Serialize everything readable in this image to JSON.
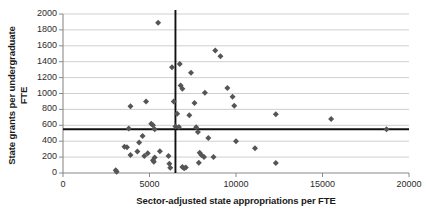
{
  "chart_data": {
    "type": "scatter",
    "title": "",
    "xlabel": "Sector-adjusted state appropriations per FTE",
    "ylabel": "State grants per undergraduate FTE",
    "xlim": [
      0,
      20000
    ],
    "ylim": [
      0,
      2000
    ],
    "xticks": [
      0,
      5000,
      10000,
      15000,
      20000
    ],
    "yticks": [
      0,
      200,
      400,
      600,
      800,
      1000,
      1200,
      1400,
      1600,
      1800,
      2000
    ],
    "grid": "horizontal",
    "legend": "none",
    "marker": "diamond",
    "marker_color": "#555555",
    "gridline_color": "#c9c9c9",
    "reference_lines": [
      {
        "orientation": "vertical",
        "value": 6500,
        "color": "#111111"
      },
      {
        "orientation": "horizontal",
        "value": 550,
        "color": "#111111"
      }
    ],
    "points": [
      {
        "x": 5500,
        "y": 1890
      },
      {
        "x": 6300,
        "y": 1330
      },
      {
        "x": 6750,
        "y": 1370
      },
      {
        "x": 8800,
        "y": 1540
      },
      {
        "x": 9100,
        "y": 1470
      },
      {
        "x": 7400,
        "y": 1260
      },
      {
        "x": 6800,
        "y": 1100
      },
      {
        "x": 6900,
        "y": 1060
      },
      {
        "x": 8200,
        "y": 1010
      },
      {
        "x": 9500,
        "y": 1070
      },
      {
        "x": 9800,
        "y": 960
      },
      {
        "x": 4800,
        "y": 900
      },
      {
        "x": 6400,
        "y": 900
      },
      {
        "x": 7600,
        "y": 880
      },
      {
        "x": 9900,
        "y": 845
      },
      {
        "x": 3900,
        "y": 840
      },
      {
        "x": 6600,
        "y": 745
      },
      {
        "x": 7300,
        "y": 725
      },
      {
        "x": 5100,
        "y": 620
      },
      {
        "x": 5200,
        "y": 600
      },
      {
        "x": 6500,
        "y": 585
      },
      {
        "x": 6700,
        "y": 580
      },
      {
        "x": 7700,
        "y": 575
      },
      {
        "x": 3800,
        "y": 560
      },
      {
        "x": 5300,
        "y": 550
      },
      {
        "x": 7800,
        "y": 515
      },
      {
        "x": 18700,
        "y": 550
      },
      {
        "x": 15500,
        "y": 680
      },
      {
        "x": 12300,
        "y": 740
      },
      {
        "x": 8400,
        "y": 440
      },
      {
        "x": 4600,
        "y": 465
      },
      {
        "x": 4400,
        "y": 385
      },
      {
        "x": 3550,
        "y": 330
      },
      {
        "x": 3700,
        "y": 325
      },
      {
        "x": 3900,
        "y": 225
      },
      {
        "x": 4300,
        "y": 270
      },
      {
        "x": 4900,
        "y": 250
      },
      {
        "x": 5600,
        "y": 275
      },
      {
        "x": 5300,
        "y": 195
      },
      {
        "x": 5200,
        "y": 160
      },
      {
        "x": 5250,
        "y": 140
      },
      {
        "x": 4700,
        "y": 215
      },
      {
        "x": 6100,
        "y": 215
      },
      {
        "x": 6150,
        "y": 115
      },
      {
        "x": 6200,
        "y": 65
      },
      {
        "x": 6900,
        "y": 75
      },
      {
        "x": 7000,
        "y": 60
      },
      {
        "x": 7100,
        "y": 70
      },
      {
        "x": 7900,
        "y": 255
      },
      {
        "x": 8000,
        "y": 225
      },
      {
        "x": 8150,
        "y": 200
      },
      {
        "x": 8700,
        "y": 200
      },
      {
        "x": 7850,
        "y": 130
      },
      {
        "x": 10000,
        "y": 400
      },
      {
        "x": 11100,
        "y": 310
      },
      {
        "x": 12300,
        "y": 125
      },
      {
        "x": 3050,
        "y": 35
      },
      {
        "x": 3100,
        "y": 15
      }
    ]
  }
}
